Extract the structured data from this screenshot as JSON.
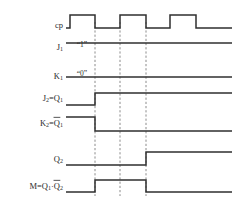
{
  "figure": {
    "kind": "digital-timing-diagram",
    "width": 239,
    "height": 207,
    "background_color": "#ffffff",
    "wave_color": "#2f2f2f",
    "marker_color": "#6f6f6f",
    "text_color": "#2b2b2b"
  },
  "signals": [
    {
      "id": "cp",
      "label_main": "cp",
      "label_sub": "",
      "label_overbar": false,
      "row_y": 26,
      "high_y": 15,
      "low_y": 28,
      "annotation": "",
      "annotation_x": 0,
      "segments": [
        {
          "from": 66,
          "to": 70,
          "level": "low"
        },
        {
          "from": 70,
          "to": 95,
          "level": "high"
        },
        {
          "from": 95,
          "to": 120,
          "level": "low"
        },
        {
          "from": 120,
          "to": 146,
          "level": "high"
        },
        {
          "from": 146,
          "to": 170,
          "level": "low"
        },
        {
          "from": 170,
          "to": 196,
          "level": "high"
        },
        {
          "from": 196,
          "to": 232,
          "level": "low"
        }
      ]
    },
    {
      "id": "j1",
      "label_main": "J",
      "label_sub": "1",
      "label_overbar": false,
      "row_y": 48,
      "high_y": 43,
      "low_y": 43,
      "annotation": "“1”",
      "annotation_x": 82,
      "segments": [
        {
          "from": 66,
          "to": 232,
          "level": "high"
        }
      ]
    },
    {
      "id": "k1",
      "label_main": "K",
      "label_sub": "1",
      "label_overbar": false,
      "row_y": 77,
      "high_y": 77,
      "low_y": 77,
      "annotation": "“0”",
      "annotation_x": 82,
      "segments": [
        {
          "from": 66,
          "to": 232,
          "level": "low"
        }
      ]
    },
    {
      "id": "j2",
      "label_main": "J",
      "label_sub": "2",
      "label_eq": "=Q",
      "label_eq_sub": "1",
      "label_overbar": false,
      "row_y": 99,
      "high_y": 93,
      "low_y": 105,
      "annotation": "",
      "annotation_x": 0,
      "segments": [
        {
          "from": 66,
          "to": 95,
          "level": "low"
        },
        {
          "from": 95,
          "to": 232,
          "level": "high"
        }
      ]
    },
    {
      "id": "k2",
      "label_main": "K",
      "label_sub": "2",
      "label_eq": "=Q",
      "label_eq_sub": "1",
      "label_overbar": true,
      "row_y": 124,
      "high_y": 117,
      "low_y": 131,
      "annotation": "",
      "annotation_x": 0,
      "segments": [
        {
          "from": 66,
          "to": 95,
          "level": "high"
        },
        {
          "from": 95,
          "to": 232,
          "level": "low"
        }
      ]
    },
    {
      "id": "q2",
      "label_main": "Q",
      "label_sub": "2",
      "label_overbar": false,
      "row_y": 160,
      "high_y": 152,
      "low_y": 165,
      "annotation": "",
      "annotation_x": 0,
      "segments": [
        {
          "from": 66,
          "to": 146,
          "level": "low"
        },
        {
          "from": 146,
          "to": 232,
          "level": "high"
        }
      ]
    },
    {
      "id": "m",
      "label_main": "M=Q",
      "label_sub": "1",
      "label_eq": "·Q",
      "label_eq_sub": "2",
      "label_overbar": true,
      "row_y": 187,
      "high_y": 180,
      "low_y": 192,
      "annotation": "",
      "annotation_x": 0,
      "segments": [
        {
          "from": 66,
          "to": 95,
          "level": "low"
        },
        {
          "from": 95,
          "to": 146,
          "level": "high"
        },
        {
          "from": 146,
          "to": 232,
          "level": "low"
        }
      ]
    }
  ],
  "markers": [
    {
      "id": "marker-1",
      "x": 95,
      "y_top": 22,
      "y_bottom": 196
    },
    {
      "id": "marker-2",
      "x": 120,
      "y_top": 22,
      "y_bottom": 196
    },
    {
      "id": "marker-3",
      "x": 146,
      "y_top": 22,
      "y_bottom": 196
    }
  ],
  "geometry": {
    "label_right_x": 63,
    "wave_start_x": 66,
    "wave_end_x": 232
  }
}
